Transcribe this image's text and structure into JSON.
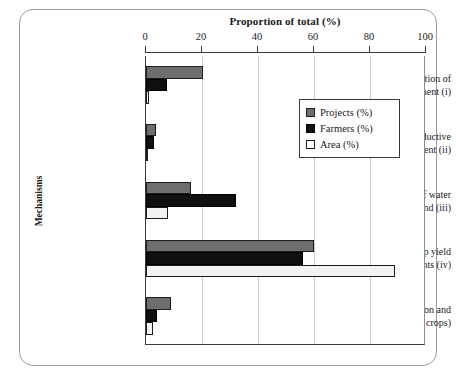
{
  "chart_data": {
    "type": "bar",
    "orientation": "horizontal",
    "title": "Proportion of total (%)",
    "xlabel": "Proportion of total (%)",
    "ylabel": "Mechanisms",
    "xlim": [
      0,
      100
    ],
    "xticks": [
      0,
      20,
      40,
      60,
      80,
      100
    ],
    "xtick_labels": [
      "0",
      "20",
      "40",
      "60",
      "80",
      "100"
    ],
    "grid": true,
    "legend_position": "upper right",
    "categories": [
      "Intensification of single component (i)",
      "New productive element (ii)",
      "Better use of water and land (iii)",
      "Per ha food crop yield improvements (iv)",
      "Other (plantation and fibre crops)"
    ],
    "category_lines": [
      [
        "Intensification of",
        "single component (i)"
      ],
      [
        "New productive",
        "element (ii)"
      ],
      [
        "Better use of water",
        "and land (iii)"
      ],
      [
        "Per ha food crop yield",
        "improvements (iv)"
      ],
      [
        "Other (plantation and",
        "fibre crops)"
      ]
    ],
    "series": [
      {
        "name": "Projects (%)",
        "color": "#6e6e6e",
        "values": [
          20.5,
          3.5,
          16.0,
          60.0,
          9.0
        ]
      },
      {
        "name": "Farmers (%)",
        "color": "#120f0f",
        "values": [
          7.5,
          3.0,
          32.0,
          56.0,
          4.0
        ]
      },
      {
        "name": "Area (%)",
        "color": "#ffffff",
        "values": [
          1.0,
          0.5,
          8.0,
          89.0,
          2.5
        ]
      }
    ]
  },
  "legend": {
    "items": [
      {
        "label": "Projects (%)",
        "swatch": "projects"
      },
      {
        "label": "Farmers (%)",
        "swatch": "farmers"
      },
      {
        "label": "Area (%)",
        "swatch": "area"
      }
    ]
  }
}
